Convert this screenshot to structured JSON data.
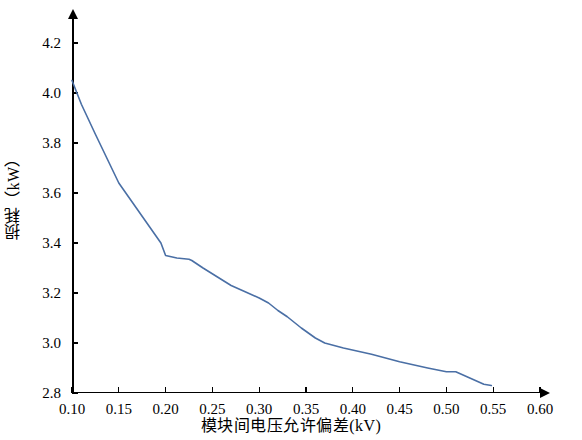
{
  "chart_data": {
    "type": "line",
    "title": "",
    "xlabel": "模块间电压允许偏差(kV)",
    "ylabel": "损耗（kW）",
    "xlim": [
      0.1,
      0.6
    ],
    "ylim": [
      2.8,
      4.3
    ],
    "xticks": [
      "0.10",
      "0.15",
      "0.20",
      "0.25",
      "0.30",
      "0.35",
      "0.40",
      "0.45",
      "0.50",
      "0.55",
      "0.60"
    ],
    "xtick_values": [
      0.1,
      0.15,
      0.2,
      0.25,
      0.3,
      0.35,
      0.4,
      0.45,
      0.5,
      0.55,
      0.6
    ],
    "yticks": [
      "2.8",
      "3.0",
      "3.2",
      "3.4",
      "3.6",
      "3.8",
      "4.0",
      "4.2"
    ],
    "ytick_values": [
      2.8,
      3.0,
      3.2,
      3.4,
      3.6,
      3.8,
      4.0,
      4.2
    ],
    "grid": false,
    "legend": null,
    "line_color": "#4a6fa5",
    "series": [
      {
        "name": "损耗",
        "x": [
          0.1,
          0.11,
          0.125,
          0.15,
          0.165,
          0.18,
          0.195,
          0.2,
          0.212,
          0.225,
          0.228,
          0.24,
          0.255,
          0.27,
          0.285,
          0.3,
          0.31,
          0.32,
          0.33,
          0.345,
          0.36,
          0.37,
          0.39,
          0.42,
          0.45,
          0.48,
          0.5,
          0.51,
          0.525,
          0.54,
          0.548
        ],
        "y": [
          4.05,
          3.955,
          3.835,
          3.64,
          3.56,
          3.48,
          3.4,
          3.35,
          3.34,
          3.335,
          3.33,
          3.3,
          3.265,
          3.23,
          3.205,
          3.18,
          3.16,
          3.13,
          3.105,
          3.06,
          3.02,
          3.0,
          2.98,
          2.955,
          2.925,
          2.9,
          2.885,
          2.885,
          2.86,
          2.835,
          2.83
        ]
      }
    ]
  },
  "axis": {
    "x_arrow": "arrow-right",
    "y_arrow": "arrow-up"
  }
}
